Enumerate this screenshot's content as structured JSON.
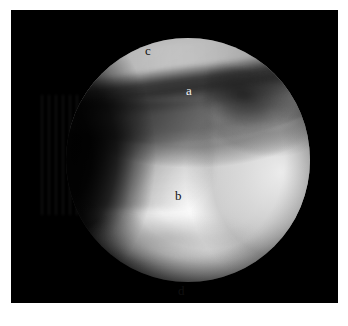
{
  "figure": {
    "kind": "arthroscopic-photograph",
    "modality": "knee arthroscopy",
    "frame_color": "#000000",
    "page_background": "#ffffff",
    "field_of_view": "circular",
    "labels": [
      {
        "id": "a",
        "text": "a",
        "tone": "light",
        "region": "soft tissue / synovium in the intercondylar area"
      },
      {
        "id": "b",
        "text": "b",
        "tone": "dark",
        "region": "femoral condyle articular surface"
      },
      {
        "id": "c",
        "text": "c",
        "tone": "dark",
        "region": "patellar / trochlear surface along the upper rim"
      },
      {
        "id": "d",
        "text": "d",
        "tone": "dark",
        "region": "lower joint compartment"
      }
    ]
  },
  "caption": {
    "text": "",
    "note": "caption clipped at the bottom page edge; glyphs not legible"
  }
}
